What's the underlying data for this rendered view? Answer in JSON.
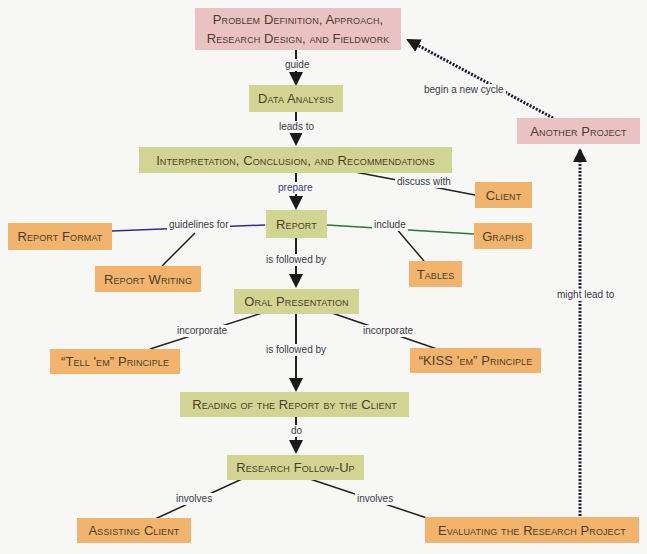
{
  "colors": {
    "process_node": "#d2d592",
    "cycle_node": "#ebc2c2",
    "detail_node": "#f2b46c",
    "background": "#f7f7f5",
    "arrow": "#1a1a1a"
  },
  "nodes": {
    "problem_definition": "Problem Definition, Approach, Research Design, and Fieldwork",
    "data_analysis": "Data Analysis",
    "interpretation": "Interpretation, Conclusion, and Recommendations",
    "report": "Report",
    "client": "Client",
    "report_format": "Report Format",
    "report_writing": "Report Writing",
    "graphs": "Graphs",
    "tables": "Tables",
    "oral_presentation": "Oral Presentation",
    "tell_em": "“Tell 'em” Principle",
    "kiss_em": "“KISS 'em” Principle",
    "reading_report": "Reading of the Report by the Client",
    "research_follow_up": "Research Follow-Up",
    "assisting_client": "Assisting Client",
    "evaluating_project": "Evaluating the Research Project",
    "another_project": "Another Project"
  },
  "links": {
    "guide": "guide",
    "leads_to": "leads to",
    "prepare": "prepare",
    "discuss_with": "discuss with",
    "guidelines_for": "guidelines for",
    "include": "include",
    "is_followed_by_1": "is followed by",
    "incorporate_left": "incorporate",
    "incorporate_right": "incorporate",
    "is_followed_by_2": "is followed by",
    "do": "do",
    "involves_left": "involves",
    "involves_right": "involves",
    "might_lead_to": "might lead to",
    "begin_new_cycle": "begin a new cycle"
  }
}
